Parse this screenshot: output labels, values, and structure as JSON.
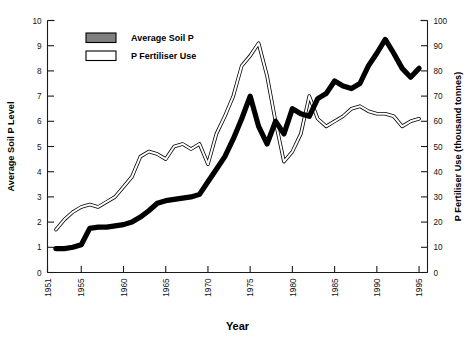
{
  "chart_data": {
    "type": "line",
    "title": "",
    "xlabel": "Year",
    "ylabel": "Average Soil P Level",
    "y2label": "P Fertiliser Use (thousand tonnes)",
    "xlim": [
      1951,
      1996
    ],
    "ylim": [
      0,
      10
    ],
    "y2lim": [
      0,
      100
    ],
    "grid": false,
    "legend_position": "top-left",
    "x_tick_labels": [
      "1951",
      "1955",
      "1960",
      "1965",
      "1970",
      "1975",
      "1980",
      "1985",
      "1990",
      "1995"
    ],
    "x_tick_values": [
      1951,
      1955,
      1960,
      1965,
      1970,
      1975,
      1980,
      1985,
      1990,
      1995
    ],
    "y_tick_labels": [
      "0",
      "1",
      "2",
      "3",
      "4",
      "5",
      "6",
      "7",
      "8",
      "9",
      "10"
    ],
    "y_tick_values": [
      0,
      1,
      2,
      3,
      4,
      5,
      6,
      7,
      8,
      9,
      10
    ],
    "y2_tick_labels": [
      "0",
      "10",
      "20",
      "30",
      "40",
      "50",
      "60",
      "70",
      "80",
      "90",
      "100"
    ],
    "y2_tick_values": [
      0,
      10,
      20,
      30,
      40,
      50,
      60,
      70,
      80,
      90,
      100
    ],
    "x": [
      1952,
      1953,
      1954,
      1955,
      1956,
      1957,
      1958,
      1959,
      1960,
      1961,
      1962,
      1963,
      1964,
      1965,
      1966,
      1967,
      1968,
      1969,
      1970,
      1971,
      1972,
      1973,
      1974,
      1975,
      1976,
      1977,
      1978,
      1979,
      1980,
      1981,
      1982,
      1983,
      1984,
      1985,
      1986,
      1987,
      1988,
      1989,
      1990,
      1991,
      1992,
      1993,
      1994,
      1995
    ],
    "series": [
      {
        "name": "Average Soil P",
        "axis": "left",
        "units": "soil P level",
        "color": "#000000",
        "style": "thick-solid",
        "values": [
          0.95,
          0.95,
          1.0,
          1.1,
          1.75,
          1.8,
          1.8,
          1.85,
          1.9,
          2.0,
          2.2,
          2.45,
          2.75,
          2.85,
          2.9,
          2.95,
          3.0,
          3.1,
          3.6,
          4.1,
          4.6,
          5.3,
          6.1,
          7.0,
          5.8,
          5.1,
          6.0,
          5.5,
          6.5,
          6.3,
          6.2,
          6.9,
          7.1,
          7.6,
          7.4,
          7.3,
          7.5,
          8.2,
          8.7,
          9.25,
          8.7,
          8.1,
          7.75,
          8.1
        ]
      },
      {
        "name": "P Fertiliser Use",
        "axis": "right",
        "units": "thousand tonnes",
        "color": "#ffffff",
        "style": "outlined-white",
        "values": [
          17,
          21,
          24,
          26,
          27,
          26,
          28,
          30,
          34,
          38,
          46,
          48,
          47,
          45,
          50,
          51,
          49,
          51,
          43,
          55,
          62,
          70,
          82,
          86,
          91,
          78,
          60,
          44,
          48,
          55,
          70,
          61,
          58,
          60,
          62,
          65,
          66,
          64,
          63,
          63,
          62,
          58,
          60,
          61
        ]
      }
    ],
    "legend": [
      {
        "label": "Average Soil P",
        "swatch_fill": "#808080",
        "swatch_stroke": "#000000"
      },
      {
        "label": "P Fertiliser Use",
        "swatch_fill": "#ffffff",
        "swatch_stroke": "#000000"
      }
    ]
  }
}
